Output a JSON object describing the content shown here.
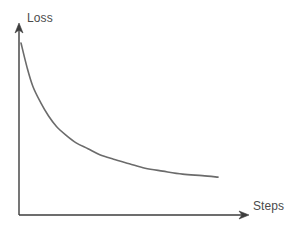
{
  "figure": {
    "name": "loss-curve-diagram",
    "background_color": "#ffffff"
  },
  "axes": {
    "y": {
      "label": "Loss",
      "color": "#3d3d3d",
      "arrow": "arrow-up",
      "x_px": 19,
      "top_px": 25,
      "bottom_px": 215
    },
    "x": {
      "label": "Steps",
      "color": "#3d3d3d",
      "arrow": "arrow-right",
      "y_px": 215,
      "left_px": 19,
      "right_px": 249
    }
  },
  "chart_data": {
    "type": "line",
    "title": "",
    "xlabel": "Steps",
    "ylabel": "Loss",
    "grid": false,
    "legend": null,
    "axis_ticks": {
      "x": [],
      "y": []
    },
    "xlim": [
      0,
      1
    ],
    "ylim": [
      0,
      1
    ],
    "series": [
      {
        "name": "training-loss",
        "color": "#6b6b6b",
        "line_width": 1.6,
        "x": [
          0.0,
          0.03,
          0.06,
          0.1,
          0.14,
          0.18,
          0.23,
          0.28,
          0.34,
          0.4,
          0.47,
          0.55,
          0.63,
          0.72,
          0.82,
          0.92,
          1.0
        ],
        "y": [
          1.0,
          0.84,
          0.71,
          0.6,
          0.51,
          0.44,
          0.38,
          0.33,
          0.29,
          0.25,
          0.22,
          0.19,
          0.16,
          0.14,
          0.12,
          0.11,
          0.1
        ],
        "description": "monotonically decreasing exponential decay curve"
      }
    ]
  },
  "curve_path": "M 21 43 C 26 78, 34 103, 46 124 C 58 145, 76 160, 100 172 C 126 185, 160 191, 218 192",
  "y_axis_path": "M 19 215 L 19 27",
  "y_arrow_points": "19,23 15,33 19,30 23,33",
  "x_axis_path": "M 19 215 L 245 215",
  "x_arrow_points": "249,215 239,211 242,215 239,219"
}
